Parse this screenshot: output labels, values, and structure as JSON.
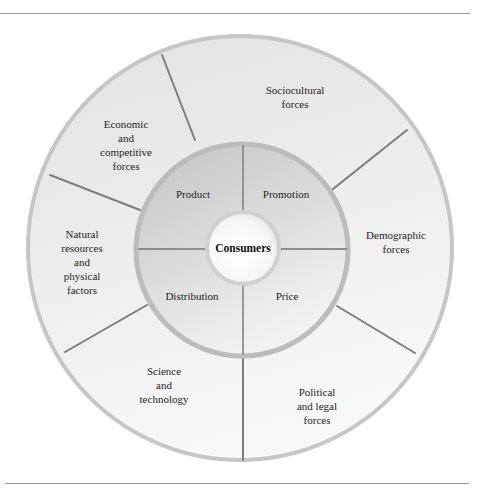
{
  "diagram": {
    "center": {
      "label": "Consumers"
    },
    "marketing_mix": [
      {
        "id": "product",
        "label": "Product"
      },
      {
        "id": "promotion",
        "label": "Promotion"
      },
      {
        "id": "distribution",
        "label": "Distribution"
      },
      {
        "id": "price",
        "label": "Price"
      }
    ],
    "environmental_forces": [
      {
        "id": "sociocultural",
        "label": "Sociocultural\nforces"
      },
      {
        "id": "demographic",
        "label": "Demographic\nforces"
      },
      {
        "id": "political-legal",
        "label": "Political\nand legal\nforces"
      },
      {
        "id": "science-technology",
        "label": "Science\nand\ntechnology"
      },
      {
        "id": "natural-resources",
        "label": "Natural\nresources\nand\nphysical\nfactors"
      },
      {
        "id": "economic-competitive",
        "label": "Economic\nand\ncompetitive\nforces"
      }
    ],
    "colors": {
      "outer_ring": "#e6e6e6",
      "outer_ring_light": "#f6f6f6",
      "outer_border": "#c4c4c4",
      "inner_ring_dark": "#c9c9c9",
      "inner_ring_light": "#ececec",
      "inner_border": "#bdbdbd",
      "center_fill": "#fafafa",
      "divider": "#7a7a7a",
      "rule": "#9a9a9a"
    }
  }
}
